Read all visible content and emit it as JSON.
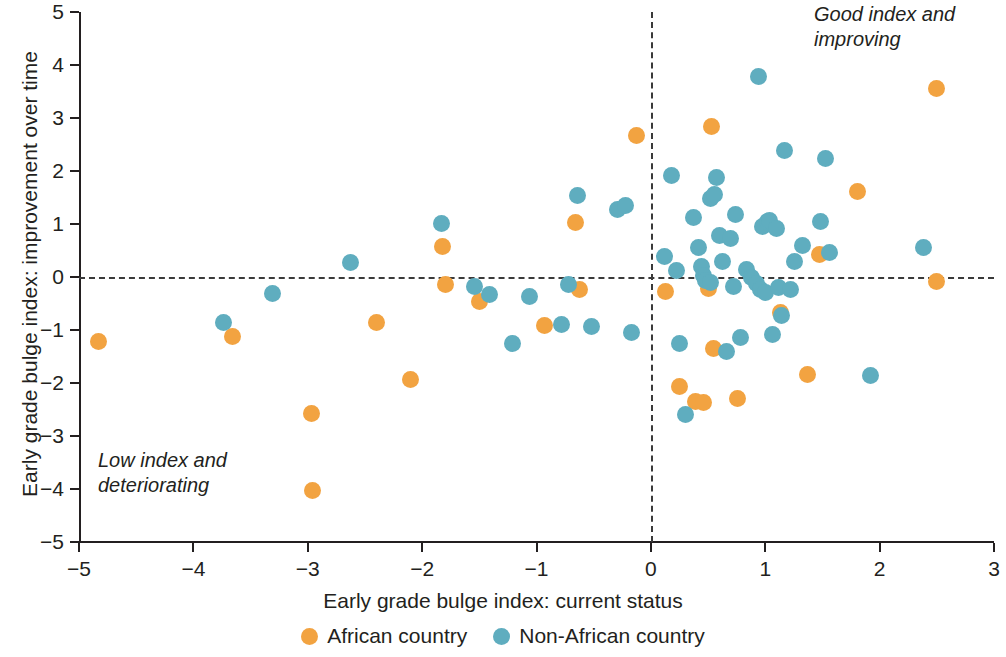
{
  "chart_data": {
    "type": "scatter",
    "title": "",
    "xlabel": "Early grade bulge index: current status",
    "ylabel": "Early grade bulge index: improvement over time",
    "xlim": [
      -5,
      3
    ],
    "ylim": [
      -5,
      5
    ],
    "xticks": [
      "−5",
      "−4",
      "−3",
      "−2",
      "−1",
      "0",
      "1",
      "2",
      "3"
    ],
    "xtick_values": [
      -5,
      -4,
      -3,
      -2,
      -1,
      0,
      1,
      2,
      3
    ],
    "yticks": [
      "5",
      "4",
      "3",
      "2",
      "1",
      "0",
      "−1",
      "−2",
      "−3",
      "−4",
      "−5"
    ],
    "ytick_values": [
      5,
      4,
      3,
      2,
      1,
      0,
      -1,
      -2,
      -3,
      -4,
      -5
    ],
    "grid": false,
    "legend_position": "bottom-center",
    "reference_lines": [
      {
        "axis": "horizontal",
        "value": 0,
        "style": "dashed"
      },
      {
        "axis": "vertical",
        "value": 0,
        "style": "dashed"
      }
    ],
    "annotations": [
      {
        "text": "Good index and improving",
        "x": 2.6,
        "y": 4.8,
        "position": "top-right"
      },
      {
        "text": "Low index and deteriorating",
        "x": -4.7,
        "y": -3.3,
        "position": "bottom-left"
      }
    ],
    "series": [
      {
        "name": "African country",
        "color": "#F2A341",
        "points": [
          [
            -4.83,
            -1.22
          ],
          [
            -3.66,
            -1.12
          ],
          [
            -2.97,
            -2.57
          ],
          [
            -2.96,
            -4.02
          ],
          [
            -2.4,
            -0.85
          ],
          [
            -2.1,
            -1.93
          ],
          [
            -1.82,
            0.57
          ],
          [
            -1.8,
            -0.14
          ],
          [
            -1.5,
            -0.47
          ],
          [
            -0.93,
            -0.91
          ],
          [
            -0.66,
            1.02
          ],
          [
            -0.62,
            -0.24
          ],
          [
            -0.13,
            2.67
          ],
          [
            0.13,
            -0.27
          ],
          [
            0.25,
            -2.06
          ],
          [
            0.39,
            -2.35
          ],
          [
            0.46,
            -2.36
          ],
          [
            0.5,
            -0.22
          ],
          [
            0.53,
            2.84
          ],
          [
            0.55,
            -1.35
          ],
          [
            0.76,
            -2.3
          ],
          [
            1.13,
            -0.67
          ],
          [
            1.37,
            -1.84
          ],
          [
            1.47,
            0.43
          ],
          [
            1.81,
            1.61
          ],
          [
            2.5,
            3.56
          ],
          [
            2.5,
            -0.08
          ]
        ]
      },
      {
        "name": "Non-African country",
        "color": "#5FADBF",
        "points": [
          [
            -3.31,
            -0.31
          ],
          [
            -3.74,
            -0.86
          ],
          [
            -2.63,
            0.27
          ],
          [
            -1.83,
            1.01
          ],
          [
            -1.54,
            -0.18
          ],
          [
            -1.41,
            -0.33
          ],
          [
            -1.21,
            -1.26
          ],
          [
            -1.06,
            -0.37
          ],
          [
            -0.78,
            -0.9
          ],
          [
            -0.72,
            -0.15
          ],
          [
            -0.64,
            1.53
          ],
          [
            -0.52,
            -0.94
          ],
          [
            -0.29,
            1.27
          ],
          [
            -0.22,
            1.35
          ],
          [
            -0.17,
            -1.05
          ],
          [
            0.12,
            0.39
          ],
          [
            0.18,
            1.92
          ],
          [
            0.22,
            0.13
          ],
          [
            0.25,
            -1.25
          ],
          [
            0.3,
            -2.59
          ],
          [
            0.37,
            1.12
          ],
          [
            0.42,
            0.55
          ],
          [
            0.44,
            0.2
          ],
          [
            0.46,
            0.02
          ],
          [
            0.48,
            -0.06
          ],
          [
            0.52,
            -0.11
          ],
          [
            0.52,
            1.49
          ],
          [
            0.56,
            1.55
          ],
          [
            0.57,
            1.88
          ],
          [
            0.6,
            0.78
          ],
          [
            0.63,
            0.3
          ],
          [
            0.66,
            -1.41
          ],
          [
            0.7,
            0.72
          ],
          [
            0.72,
            -0.17
          ],
          [
            0.74,
            1.18
          ],
          [
            0.78,
            -1.15
          ],
          [
            0.84,
            0.15
          ],
          [
            0.88,
            0.0
          ],
          [
            0.92,
            -0.12
          ],
          [
            0.94,
            3.79
          ],
          [
            0.96,
            -0.23
          ],
          [
            0.98,
            0.95
          ],
          [
            1.0,
            -0.3
          ],
          [
            1.02,
            1.05
          ],
          [
            1.04,
            1.06
          ],
          [
            1.06,
            -1.08
          ],
          [
            1.1,
            0.91
          ],
          [
            1.12,
            -0.19
          ],
          [
            1.14,
            -0.73
          ],
          [
            1.17,
            2.39
          ],
          [
            1.22,
            -0.24
          ],
          [
            1.26,
            0.29
          ],
          [
            1.33,
            0.6
          ],
          [
            1.48,
            1.05
          ],
          [
            1.53,
            2.24
          ],
          [
            1.56,
            0.46
          ],
          [
            1.92,
            -1.85
          ],
          [
            2.38,
            0.55
          ]
        ]
      }
    ]
  },
  "legend": {
    "items": [
      {
        "label": "African country",
        "color": "#F2A341"
      },
      {
        "label": "Non-African country",
        "color": "#5FADBF"
      }
    ]
  },
  "annotations": {
    "good": "Good index and improving",
    "low": "Low index and deteriorating"
  },
  "axes": {
    "x_title": "Early grade bulge index: current status",
    "y_title": "Early grade bulge index: improvement over time"
  }
}
